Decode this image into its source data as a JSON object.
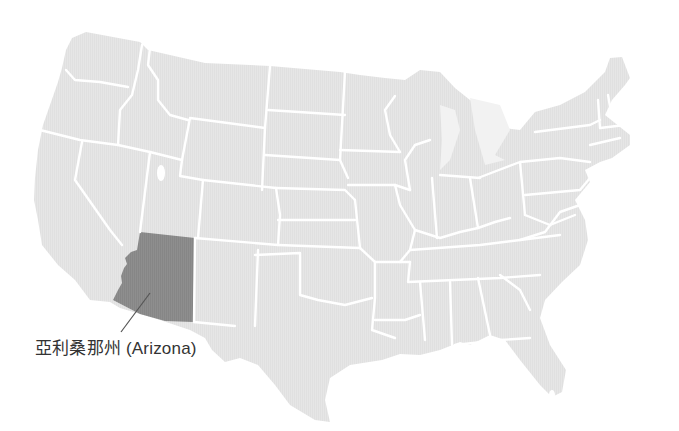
{
  "map": {
    "title": "United States map",
    "highlighted_state": {
      "name_zh": "亞利桑那州",
      "name_en": "Arizona",
      "label": "亞利桑那州 (Arizona)"
    },
    "colors": {
      "background": "#ffffff",
      "land": "#e4e4e4",
      "borders": "#ffffff",
      "highlight": "#8c8c8c",
      "leader_line": "#555555",
      "label_text": "#333333"
    }
  }
}
